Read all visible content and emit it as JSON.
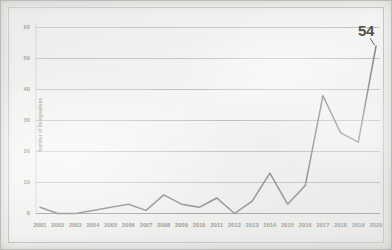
{
  "chart_data": {
    "type": "line",
    "title": "",
    "xlabel": "",
    "ylabel": "Number of Designations",
    "ylim": [
      0,
      60
    ],
    "yticks": [
      0,
      10,
      20,
      30,
      40,
      50,
      60
    ],
    "grid": true,
    "legend": "none",
    "categories": [
      "2001",
      "2002",
      "2003",
      "2004",
      "2005",
      "2006",
      "2007",
      "2008",
      "2009",
      "2010",
      "2011",
      "2012",
      "2013",
      "2014",
      "2015",
      "2016",
      "2017",
      "2018",
      "2019",
      "2020"
    ],
    "series": [
      {
        "name": "Number of Designations",
        "values": [
          2,
          0,
          0,
          1,
          2,
          3,
          1,
          6,
          3,
          2,
          5,
          0,
          4,
          13,
          3,
          9,
          38,
          26,
          23,
          54
        ],
        "color": "#6b6b69"
      }
    ],
    "annotations": [
      {
        "label": "54",
        "x": "2020",
        "y": 54
      }
    ]
  },
  "figure": {
    "background_color": "#f2f2f0",
    "grid_color": "#9a9a98",
    "axis_color": "#8a8a88",
    "tick_color": "#6f6f6d",
    "frame_color": "#bdbdbb"
  }
}
